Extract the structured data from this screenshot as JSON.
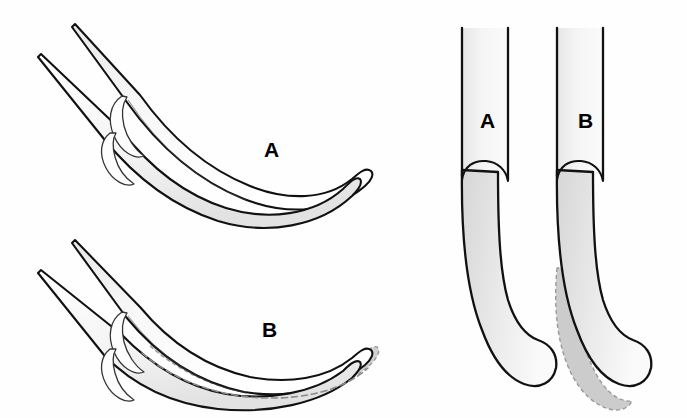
{
  "figure": {
    "background_color": "#fefefe",
    "width": 687,
    "height": 418,
    "stroke_color": "#111111",
    "dashed_color": "#8a8a8a",
    "shade_light": "#f2f2f2",
    "shade_mid": "#d8d8d8",
    "shade_dark": "#c2c2c2",
    "panels": [
      {
        "id": "lateral-view-a",
        "view": "lateral",
        "label": "A",
        "label_x": 264,
        "label_y": 157,
        "label_size": 21,
        "has_dashed_overlay": false,
        "description": "Curved blade shown from the side, normal profile"
      },
      {
        "id": "lateral-view-b",
        "view": "lateral",
        "label": "B",
        "label_x": 262,
        "label_y": 337,
        "label_size": 21,
        "has_dashed_overlay": true,
        "description": "Curved blade shown from the side with dashed outline indicating added bulk along the lower margin"
      },
      {
        "id": "frontal-view-a",
        "view": "frontal",
        "label": "A",
        "label_x": 480,
        "label_y": 128,
        "label_size": 21,
        "has_dashed_overlay": false,
        "description": "Straight shaft with rounded curving tip, front view"
      },
      {
        "id": "frontal-view-b",
        "view": "frontal",
        "label": "B",
        "label_x": 578,
        "label_y": 128,
        "label_size": 21,
        "has_dashed_overlay": true,
        "description": "Straight shaft with rounded curving tip and dashed shaded margin on the outer edge, front view"
      }
    ]
  }
}
